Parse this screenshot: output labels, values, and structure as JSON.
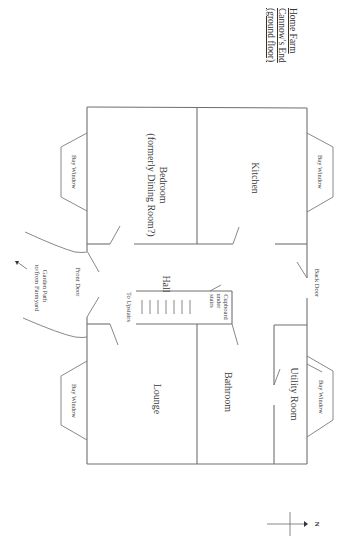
{
  "title": {
    "lines": [
      "Home Farm",
      "Cannow's End",
      "(ground floor)"
    ]
  },
  "rooms": {
    "bedroom": {
      "name": "Bedroom",
      "note": "(formerly Dining Room?)"
    },
    "kitchen": {
      "name": "Kitchen"
    },
    "hall": {
      "name": "Hall"
    },
    "lounge": {
      "name": "Lounge"
    },
    "bathroom": {
      "name": "Bathroom"
    },
    "utility": {
      "name": "Utility Room"
    }
  },
  "features": {
    "bay_window_label": "Bay Window",
    "front_door": "Front Door",
    "back_door": "Back Door",
    "to_upstairs": "To Upstairs",
    "cupboard": [
      "Cupboard",
      "under",
      "stairs"
    ],
    "garden_path": [
      "Garden Path",
      "to/from Farmyard"
    ]
  },
  "compass": {
    "label": "N"
  },
  "colors": {
    "line": "#6f6f6f",
    "text": "#3a3a3a",
    "background": "#ffffff"
  }
}
